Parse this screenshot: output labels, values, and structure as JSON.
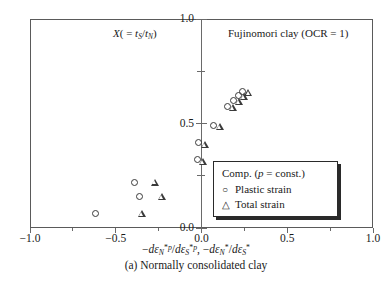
{
  "figure": {
    "caption": "(a) Normally consolidated clay",
    "annotation_left_plain": "X( = tS/tN)",
    "annotation_right": "Fujinomori clay (OCR = 1)",
    "xtitle_plain": "-dεN*p/dεS*p, -dεN*/dεS*"
  },
  "legend": {
    "title_plain": "Comp. (p = const.)",
    "items": [
      {
        "glyph": "○",
        "label": "Plastic strain",
        "marker": "circle"
      },
      {
        "glyph": "△",
        "label": "Total strain",
        "marker": "triangle"
      }
    ]
  },
  "chart_data": {
    "type": "scatter",
    "title": "",
    "subtitle": "Fujinomori clay (OCR = 1)",
    "xlabel": "-dεN*p/dεS*p, -dεN*/dεS*",
    "ylabel": "X( = tS/tN)",
    "xlim": [
      -1.0,
      1.0
    ],
    "ylim": [
      0.0,
      1.0
    ],
    "xticks": [
      -1.0,
      -0.5,
      0.0,
      0.5,
      1.0
    ],
    "xticklabels": [
      "-1.0",
      "-0.5",
      "0.0",
      "0.5",
      "1.0"
    ],
    "yticks": [
      0.0,
      0.5,
      1.0
    ],
    "yticklabels": [
      "0.0",
      "0.5",
      "1.0"
    ],
    "yminorticks": [
      0.25,
      0.75
    ],
    "grid": false,
    "axis_position": "y-axis at x=0 (center spine)",
    "legend_position": "lower right inside axes",
    "series": [
      {
        "name": "Plastic strain",
        "marker": "circle",
        "points": [
          [
            -0.62,
            0.07
          ],
          [
            -0.39,
            0.22
          ],
          [
            -0.36,
            0.15
          ],
          [
            -0.025,
            0.33
          ],
          [
            -0.015,
            0.41
          ],
          [
            0.07,
            0.49
          ],
          [
            0.15,
            0.58
          ],
          [
            0.185,
            0.61
          ],
          [
            0.215,
            0.635
          ],
          [
            0.24,
            0.655
          ]
        ]
      },
      {
        "name": "Total strain",
        "marker": "triangle",
        "points": [
          [
            -0.37,
            0.07
          ],
          [
            -0.295,
            0.22
          ],
          [
            -0.255,
            0.15
          ],
          [
            -0.015,
            0.32
          ],
          [
            -0.005,
            0.4
          ],
          [
            0.085,
            0.485
          ],
          [
            0.16,
            0.575
          ],
          [
            0.195,
            0.605
          ],
          [
            0.225,
            0.63
          ],
          [
            0.25,
            0.65
          ]
        ]
      }
    ]
  }
}
